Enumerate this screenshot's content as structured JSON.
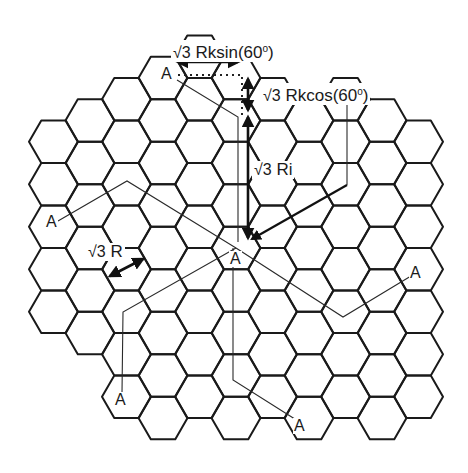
{
  "figure": {
    "type": "hexagonal cellular reuse grid",
    "width": 468,
    "height": 473,
    "colors": {
      "line": "#1a1a1a",
      "background": "#ffffff"
    },
    "hex_grid": {
      "orientation": "flat-top",
      "side": 24.5,
      "col_spacing": 36.5,
      "row_spacing": 42.5,
      "origin_col_x": 53.5,
      "columns": [
        {
          "col": 0,
          "top": 141.75,
          "bottom": 311.75
        },
        {
          "col": 1,
          "top": 120.5,
          "bottom": 333
        },
        {
          "col": 2,
          "top": 99.25,
          "bottom": 396.75
        },
        {
          "col": 3,
          "top": 78,
          "bottom": 418
        },
        {
          "col": 4,
          "top": 56.75,
          "bottom": 396.75
        },
        {
          "col": 5,
          "top": 78,
          "bottom": 418
        },
        {
          "col": 6,
          "top": 99.25,
          "bottom": 396.75
        },
        {
          "col": 7,
          "top": 120.5,
          "bottom": 418
        },
        {
          "col": 8,
          "top": 99.25,
          "bottom": 396.75
        },
        {
          "col": 9,
          "top": 120.5,
          "bottom": 418
        },
        {
          "col": 10,
          "top": 141.75,
          "bottom": 396.75
        }
      ]
    },
    "cell_labels": [
      {
        "id": "a-top",
        "text": "A",
        "x": 160,
        "y": 66
      },
      {
        "id": "a-left",
        "text": "A",
        "x": 45,
        "y": 214
      },
      {
        "id": "a-center",
        "text": "A",
        "x": 229,
        "y": 251
      },
      {
        "id": "a-right",
        "text": "A",
        "x": 409,
        "y": 265
      },
      {
        "id": "a-bottom-left",
        "text": "A",
        "x": 114,
        "y": 392
      },
      {
        "id": "a-bottom-right",
        "text": "A",
        "x": 293,
        "y": 418
      }
    ],
    "annotations": {
      "rksin": {
        "sqrt": "√3",
        "text": " Rksin(60",
        "sup": "o",
        "close": ")",
        "x": 171,
        "y": 40
      },
      "rkcos": {
        "sqrt": "√3",
        "text": " Rkcos(60",
        "sup": "o",
        "close": ")",
        "x": 261,
        "y": 83
      },
      "ri": {
        "sqrt": "√3",
        "text": " Ri",
        "x": 252,
        "y": 161
      },
      "r": {
        "sqrt": "√3",
        "text": " R",
        "x": 86,
        "y": 243
      }
    },
    "connector_paths": [
      {
        "id": "path-top",
        "points": [
          [
            177,
            80
          ],
          [
            238,
            117
          ],
          [
            238,
            242
          ]
        ]
      },
      {
        "id": "path-left",
        "points": [
          [
            58,
            221
          ],
          [
            127,
            181
          ],
          [
            236,
            248
          ]
        ]
      },
      {
        "id": "path-bottom-left",
        "points": [
          [
            236,
            248
          ],
          [
            123,
            312
          ],
          [
            122,
            393
          ]
        ]
      },
      {
        "id": "path-bottom-right",
        "points": [
          [
            233,
            248
          ],
          [
            233,
            380
          ],
          [
            298,
            421
          ]
        ]
      },
      {
        "id": "path-right",
        "points": [
          [
            236,
            248
          ],
          [
            343,
            317
          ],
          [
            411,
            276
          ]
        ]
      },
      {
        "id": "path-upper-right",
        "points": [
          [
            347,
            185
          ],
          [
            347,
            104
          ]
        ]
      }
    ]
  }
}
